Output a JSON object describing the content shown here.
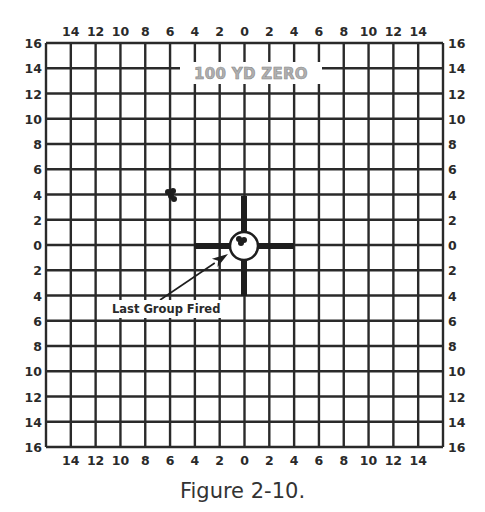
{
  "figure": {
    "title": "100 YD ZERO",
    "caption": "Figure 2-10.",
    "annotation": "Last Group Fired"
  },
  "grid": {
    "left": 46,
    "top": 43,
    "right": 443,
    "bottom": 447,
    "columns": 16,
    "rows": 16,
    "line_color": "#2a2a2a",
    "line_width": 2.4
  },
  "axes": {
    "top_labels": [
      "14",
      "12",
      "10",
      "8",
      "6",
      "4",
      "2",
      "0",
      "2",
      "4",
      "6",
      "8",
      "10",
      "12",
      "14"
    ],
    "bottom_labels": [
      "14",
      "12",
      "10",
      "8",
      "6",
      "4",
      "2",
      "0",
      "2",
      "4",
      "6",
      "8",
      "10",
      "12",
      "14"
    ],
    "left_labels": [
      "16",
      "14",
      "12",
      "10",
      "8",
      "6",
      "4",
      "2",
      "0",
      "2",
      "4",
      "6",
      "8",
      "10",
      "12",
      "14",
      "16"
    ],
    "right_labels": [
      "16",
      "14",
      "12",
      "10",
      "8",
      "6",
      "4",
      "2",
      "0",
      "2",
      "4",
      "6",
      "8",
      "10",
      "12",
      "14",
      "16"
    ]
  },
  "target": {
    "center_x": 244,
    "center_y": 246,
    "circle_radius": 14,
    "bar_half_length": 50,
    "bar_thickness": 6,
    "color": "#1e1e1e"
  },
  "shot_groups": [
    {
      "name": "earlier-group",
      "x": 170,
      "y": 194,
      "holes": [
        [
          -2,
          -2
        ],
        [
          3,
          -3
        ],
        [
          1,
          2
        ],
        [
          4,
          5
        ]
      ]
    },
    {
      "name": "last-group",
      "x": 241,
      "y": 240,
      "holes": [
        [
          -2,
          -1
        ],
        [
          3,
          0
        ],
        [
          0,
          3
        ]
      ]
    }
  ],
  "arrow": {
    "from_x": 160,
    "from_y": 300,
    "to_x": 228,
    "to_y": 254
  },
  "annotation_band": {
    "x": 108,
    "y": 300,
    "w": 122,
    "h": 18
  },
  "title_band": {
    "x": 180,
    "y": 62,
    "w": 142,
    "h": 22
  }
}
